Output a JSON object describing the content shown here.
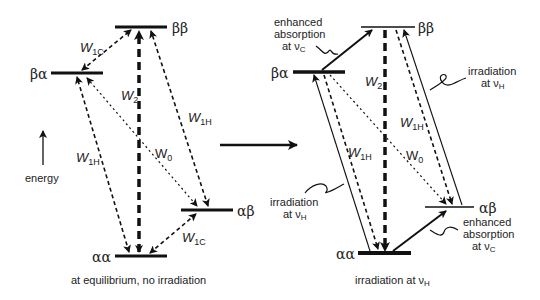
{
  "left_panel": {
    "caption": "at equilibrium, no irradiation",
    "energy_label": "energy",
    "levels": {
      "bb": "ββ",
      "ba": "βα",
      "ab": "αβ",
      "aa": "αα"
    },
    "rates": {
      "w1c_top": {
        "main": "W",
        "sub": "1C"
      },
      "w1c_bottom": {
        "main": "W",
        "sub": "1C"
      },
      "w2": {
        "main": "W",
        "sub": "2"
      },
      "w1h_left": {
        "main": "W",
        "sub": "1H"
      },
      "w1h_right": {
        "main": "W",
        "sub": "1H"
      },
      "w0": {
        "main": "W",
        "sub": "0"
      }
    }
  },
  "right_panel": {
    "caption_main": "irradiation at ν",
    "caption_sub": "H",
    "levels": {
      "bb": "ββ",
      "ba": "βα",
      "ab": "αβ",
      "aa": "αα"
    },
    "rates": {
      "w2": {
        "main": "W",
        "sub": "2"
      },
      "w1h_left": {
        "main": "W",
        "sub": "1H"
      },
      "w1h_right": {
        "main": "W",
        "sub": "1H"
      },
      "w0": {
        "main": "W",
        "sub": "0"
      }
    },
    "annotations": {
      "enhanced_top": {
        "line1": "enhanced",
        "line2": "absorption",
        "line3": "at  ν",
        "sub": "C"
      },
      "enhanced_bottom": {
        "line1": "enhanced",
        "line2": "absorption",
        "line3": "at  ν",
        "sub": "C"
      },
      "irr_right": {
        "line1": "irradiation",
        "line2": "at  ν",
        "sub": "H"
      },
      "irr_left": {
        "line1": "irradiation",
        "line2": "at  ν",
        "sub": "H"
      }
    }
  },
  "colors": {
    "ink": "#111111",
    "background": "#ffffff"
  }
}
